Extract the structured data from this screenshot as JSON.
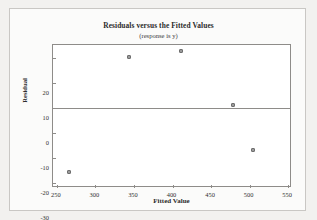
{
  "chart_data": {
    "type": "scatter",
    "title": "Residuals versus the Fitted Values",
    "subtitle": "(response is y)",
    "xlabel": "Fitted Value",
    "ylabel": "Residual",
    "xlim": [
      245,
      555
    ],
    "ylim": [
      -32,
      25
    ],
    "xticks": [
      250,
      300,
      350,
      400,
      450,
      500,
      550
    ],
    "yticks": [
      20,
      10,
      0,
      -10,
      -20,
      -30
    ],
    "grid": false,
    "legend": null,
    "reference_lines": [
      {
        "axis": "y",
        "value": 0
      }
    ],
    "marker_color": "#9a9a9a",
    "frame_color": "#8e8c89",
    "points": [
      {
        "x": 266,
        "y": -25.6
      },
      {
        "x": 343,
        "y": 20.4
      },
      {
        "x": 411,
        "y": 22.8
      },
      {
        "x": 478,
        "y": 1.2
      },
      {
        "x": 504,
        "y": -16.8
      }
    ]
  },
  "figure": {
    "title": "Residuals versus the Fitted Values",
    "subtitle": "(response is y)",
    "x_axis_title": "Fitted Value",
    "y_axis_title": "Residual"
  }
}
